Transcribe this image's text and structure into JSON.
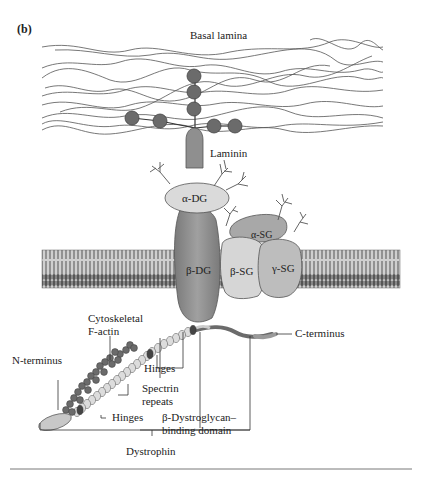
{
  "figure": {
    "panel_label": "(b)",
    "labels": {
      "basal_lamina": "Basal lamina",
      "laminin": "Laminin",
      "alpha_dg": "α-DG",
      "beta_dg": "β-DG",
      "alpha_sg": "α-SG",
      "beta_sg": "β-SG",
      "gamma_sg": "γ-SG",
      "cytoskeletal_line1": "Cytoskeletal",
      "cytoskeletal_line2": "F-actin",
      "n_terminus": "N-terminus",
      "hinges_upper": "Hinges",
      "spectrin_line1": "Spectrin",
      "spectrin_line2": "repeats",
      "hinges_lower": "Hinges",
      "c_terminus": "C-terminus",
      "bdg_binding_line1": "β-Dystroglycan–",
      "bdg_binding_line2": "binding domain",
      "dystrophin": "Dystrophin"
    },
    "colors": {
      "dark_protein": "#6b6b6b",
      "medium_protein": "#9a9a9a",
      "light_protein": "#d9d9d9",
      "membrane": "#7a7a7a",
      "line": "#333333"
    }
  }
}
